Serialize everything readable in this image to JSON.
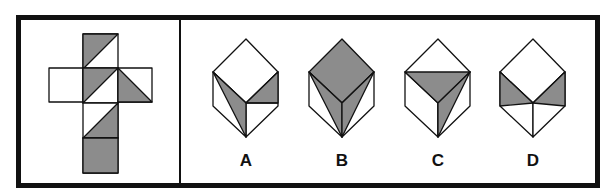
{
  "puzzle": {
    "type": "cube-net-folding",
    "colors": {
      "shade": "#8c8c8c",
      "line": "#111111",
      "background": "#ffffff"
    },
    "net": {
      "squares": [
        {
          "id": "top",
          "x": 83,
          "y": 34,
          "size": 35,
          "shading": "upper-left-gray",
          "diagonal": "bl-tr"
        },
        {
          "id": "left",
          "x": 49,
          "y": 68,
          "size": 34,
          "shading": "none",
          "diagonal": "none"
        },
        {
          "id": "center",
          "x": 83,
          "y": 68,
          "size": 35,
          "shading": "upper-left-gray",
          "diagonal": "bl-tr"
        },
        {
          "id": "right",
          "x": 118,
          "y": 68,
          "size": 34,
          "shading": "lower-left-gray",
          "diagonal": "tl-br"
        },
        {
          "id": "lower",
          "x": 83,
          "y": 103,
          "size": 35,
          "shading": "lower-right-gray",
          "diagonal": "bl-tr"
        },
        {
          "id": "bottom",
          "x": 83,
          "y": 138,
          "size": 35,
          "shading": "full-gray",
          "diagonal": "none"
        }
      ]
    },
    "options": [
      {
        "label": "A",
        "cx": 246,
        "top_face": "white",
        "left_face": "gray triangle (left-top, center-bottom edge to bottom)",
        "right_face": "gray upper triangle"
      },
      {
        "label": "B",
        "cx": 342,
        "top_face": "gray",
        "left_face": "gray triangle",
        "right_face": "gray triangle"
      },
      {
        "label": "C",
        "cx": 438,
        "top_face": "lower half gray",
        "left_face": "white",
        "right_face": "gray left triangle"
      },
      {
        "label": "D",
        "cx": 533,
        "top_face": "white",
        "left_face": "upper triangle gray",
        "right_face": "upper triangle gray"
      }
    ]
  }
}
